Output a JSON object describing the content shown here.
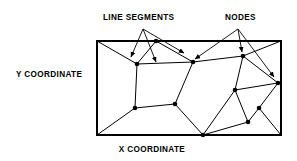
{
  "figure": {
    "type": "diagram",
    "background_color": "#ffffff",
    "ink_color": "#000000"
  },
  "labels": {
    "line_segments": "LINE SEGMENTS",
    "nodes": "NODES",
    "y_axis": "Y  COORDINATE",
    "x_axis": "X  COORDINATE"
  },
  "plot_frame": {
    "x": 97,
    "y": 41,
    "width": 184,
    "height": 94,
    "stroke_width": 2.0
  },
  "diagram_data": {
    "node_radius": 2.3,
    "network_nodes": [
      {
        "id": "n1",
        "x": 137,
        "y": 64
      },
      {
        "id": "n2",
        "x": 193,
        "y": 62
      },
      {
        "id": "n3",
        "x": 243,
        "y": 56
      },
      {
        "id": "n4",
        "x": 135,
        "y": 108
      },
      {
        "id": "n5",
        "x": 175,
        "y": 104
      },
      {
        "id": "n6",
        "x": 235,
        "y": 90
      },
      {
        "id": "n7",
        "x": 278,
        "y": 83
      },
      {
        "id": "n8",
        "x": 259,
        "y": 108
      },
      {
        "id": "n9",
        "x": 248,
        "y": 122
      },
      {
        "id": "n10",
        "x": 203,
        "y": 135
      },
      {
        "id": "n11",
        "x": 156,
        "y": 41
      },
      {
        "id": "n12",
        "x": 97,
        "y": 135
      },
      {
        "id": "n13",
        "x": 97,
        "y": 41
      },
      {
        "id": "n14",
        "x": 281,
        "y": 135
      },
      {
        "id": "n15",
        "x": 281,
        "y": 41
      }
    ],
    "line_segments": [
      {
        "from": "n13",
        "to": "n1"
      },
      {
        "from": "n11",
        "to": "n1"
      },
      {
        "from": "n1",
        "to": "n2"
      },
      {
        "from": "n2",
        "to": "n3"
      },
      {
        "from": "n2",
        "to": "n11"
      },
      {
        "from": "n3",
        "to": "n15"
      },
      {
        "from": "n3",
        "to": "n7"
      },
      {
        "from": "n3",
        "to": "n6"
      },
      {
        "from": "n1",
        "to": "n4"
      },
      {
        "from": "n2",
        "to": "n5"
      },
      {
        "from": "n4",
        "to": "n5"
      },
      {
        "from": "n4",
        "to": "n12"
      },
      {
        "from": "n5",
        "to": "n10"
      },
      {
        "from": "n6",
        "to": "n7"
      },
      {
        "from": "n6",
        "to": "n10"
      },
      {
        "from": "n6",
        "to": "n9"
      },
      {
        "from": "n7",
        "to": "n8"
      },
      {
        "from": "n8",
        "to": "n9"
      },
      {
        "from": "n8",
        "to": "n14"
      },
      {
        "from": "n9",
        "to": "n10"
      },
      {
        "from": "n10",
        "to": "n14"
      }
    ],
    "leaders": {
      "line_segments": {
        "origin": {
          "x": 143,
          "y": 29
        },
        "arrows": [
          {
            "to": {
              "x": 131,
              "y": 57
            }
          },
          {
            "to": {
              "x": 156,
              "y": 62
            }
          },
          {
            "to": {
              "x": 184,
              "y": 53
            }
          }
        ]
      },
      "nodes": {
        "origin": {
          "x": 238,
          "y": 29
        },
        "arrows": [
          {
            "to": {
              "x": 195,
              "y": 59
            }
          },
          {
            "to": {
              "x": 242,
              "y": 52
            }
          },
          {
            "to": {
              "x": 274,
              "y": 77
            }
          }
        ]
      }
    },
    "label_positions": {
      "line_segments": {
        "x": 103,
        "y": 20
      },
      "nodes": {
        "x": 225,
        "y": 20
      },
      "y_axis": {
        "x": 16,
        "y": 77
      },
      "x_axis": {
        "x": 152,
        "y": 152
      }
    }
  }
}
